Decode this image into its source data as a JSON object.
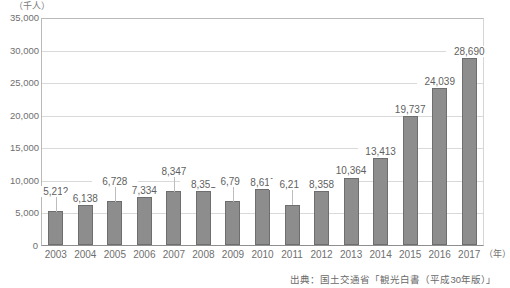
{
  "chart_data": {
    "type": "bar",
    "title": "",
    "subtitle": "",
    "unit_label": "（千人）",
    "xlabel": "（年）",
    "ylabel": "",
    "ylim": [
      0,
      35000
    ],
    "ytick_step": 5000,
    "grid": true,
    "legend": null,
    "categories": [
      "2003",
      "2004",
      "2005",
      "2006",
      "2007",
      "2008",
      "2009",
      "2010",
      "2011",
      "2012",
      "2013",
      "2014",
      "2015",
      "2016",
      "2017"
    ],
    "values": [
      5212,
      6138,
      6728,
      7334,
      8347,
      8351,
      6790,
      8611,
      6219,
      8358,
      10364,
      13413,
      19737,
      24039,
      28690
    ],
    "value_labels": [
      "5,212",
      "6,138",
      "6,728",
      "7,334",
      "8,347",
      "8,351",
      "6,790",
      "8,611",
      "6,219",
      "8,358",
      "10,364",
      "13,413",
      "19,737",
      "24,039",
      "28,690"
    ],
    "ytick_labels": [
      "35,000",
      "30,000",
      "25,000",
      "20,000",
      "15,000",
      "10,000",
      "5,000",
      "0"
    ],
    "ytick_values": [
      35000,
      30000,
      25000,
      20000,
      15000,
      10000,
      5000,
      0
    ],
    "bar_color": "#8d8d8d",
    "bar_border_color": "#6e6e6e",
    "grid_color": "#d9d9d9",
    "axis_color": "#8e8e8e",
    "text_color": "#6f6f6f",
    "annotation": "出典：国土交通省「観光白書（平成30年版）」"
  },
  "source": {
    "text": "出典：国土交通省「観光白書（平成30年版）」"
  }
}
